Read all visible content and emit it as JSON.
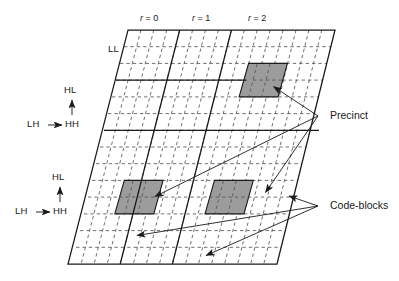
{
  "figure": {
    "type": "diagram",
    "colors": {
      "line": "#1a1a1a",
      "dashed_grid": "#4d4d4d",
      "shaded_fill": "#9c9c9c",
      "shaded_stroke": "#1a1a1a",
      "background": "#ffffff"
    },
    "resolution_labels": [
      {
        "id": "r0",
        "prefix": "r",
        "eq": " = 0",
        "text": "r = 0"
      },
      {
        "id": "r1",
        "prefix": "r",
        "eq": " = 1",
        "text": "r = 1"
      },
      {
        "id": "r2",
        "prefix": "r",
        "eq": " = 2",
        "text": "r = 2"
      }
    ],
    "subband_labels": {
      "ll": "LL",
      "group_upper": {
        "hl": "HL",
        "lh": "LH",
        "hh": "HH",
        "arrow_up": "↑",
        "arrow_right": "→"
      },
      "group_lower": {
        "hl": "HL",
        "lh": "LH",
        "hh": "HH",
        "arrow_up": "↑",
        "arrow_right": "→"
      }
    },
    "callouts": [
      {
        "id": "precinct",
        "label": "Precinct",
        "arrow_count": 3
      },
      {
        "id": "code-blocks",
        "label": "Code-blocks",
        "arrow_count": 3
      }
    ],
    "shaded_regions": [
      {
        "id": "precinct-r2-hl",
        "cols": 3,
        "rows": 2
      },
      {
        "id": "codeblock-lower-left",
        "cols": 3,
        "rows": 2
      },
      {
        "id": "codeblock-lower-mid",
        "cols": 3,
        "rows": 2
      }
    ]
  }
}
